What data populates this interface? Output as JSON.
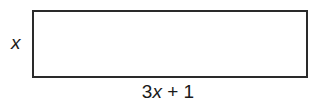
{
  "diagram": {
    "shape": "rectangle",
    "side_label": {
      "variable": "x",
      "text": "x"
    },
    "bottom_label": {
      "coefficient": "3",
      "variable": "x",
      "operator_and_constant": " + 1",
      "text": "3x + 1"
    },
    "colors": {
      "stroke": "#2a2a2a",
      "fill": "#ffffff",
      "text": "#1a1a1a"
    }
  }
}
